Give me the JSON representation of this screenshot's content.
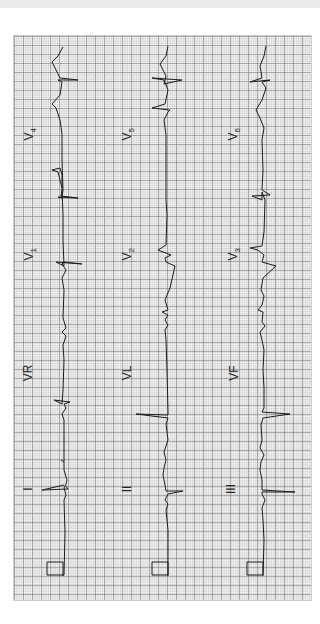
{
  "figure": {
    "type": "12-lead electrocardiogram",
    "orientation": "rotated 90 degrees counter-clockwise (labels read bottom-to-top)",
    "colors": {
      "trace": "#1a1a1a",
      "grid_major": "#8a8a8a",
      "grid_minor": "#c4c4c4",
      "background": "#ffffff"
    },
    "layout": "3 rows x 4 columns",
    "rows": [
      {
        "leads": [
          "I",
          "VR",
          "V1",
          "V4"
        ]
      },
      {
        "leads": [
          "II",
          "VL",
          "V2",
          "V5"
        ]
      },
      {
        "leads": [
          "III",
          "VF",
          "V3",
          "V6"
        ]
      }
    ]
  },
  "labels": {
    "I": "I",
    "II": "II",
    "III": "III",
    "VR": "VR",
    "VL": "VL",
    "VF": "VF",
    "V1": "V",
    "V1_sub": "1",
    "V2": "V",
    "V2_sub": "2",
    "V3": "V",
    "V3_sub": "3",
    "V4": "V",
    "V4_sub": "4",
    "V5": "V",
    "V5_sub": "5",
    "V6": "V",
    "V6_sub": "6"
  },
  "calibration": {
    "count": 3,
    "shape": "square pulse"
  }
}
